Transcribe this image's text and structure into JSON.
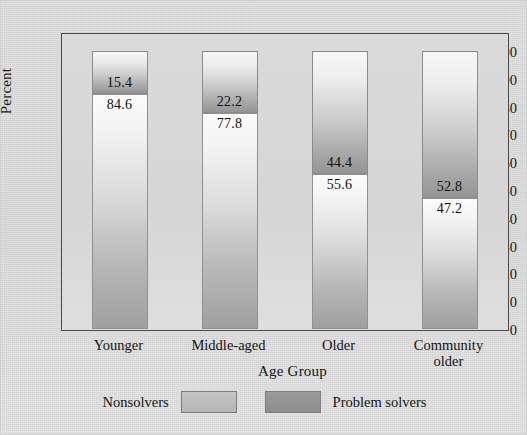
{
  "chart_data": {
    "type": "bar",
    "subtype": "stacked-bar-100",
    "title": "",
    "xlabel": "Age Group",
    "ylabel": "Percent",
    "ylim": [
      0,
      100
    ],
    "yticks": [
      0,
      10,
      20,
      30,
      40,
      50,
      60,
      70,
      80,
      90,
      100
    ],
    "ytick_labels": [
      "0",
      "10",
      "20",
      "30",
      "40",
      "50",
      "60",
      "70",
      "80",
      "90",
      "100"
    ],
    "grid": false,
    "legend_position": "bottom",
    "categories": [
      "Younger",
      "Middle-aged",
      "Older",
      "Community older"
    ],
    "category_lines": [
      [
        "Younger"
      ],
      [
        "Middle-aged"
      ],
      [
        "Older"
      ],
      [
        "Community",
        "older"
      ]
    ],
    "series": [
      {
        "name": "Nonsolvers",
        "values": [
          84.6,
          77.8,
          55.6,
          47.2
        ],
        "value_labels": [
          "84.6",
          "77.8",
          "55.6",
          "47.2"
        ],
        "color": "#bdbdbd",
        "stack_position": "bottom"
      },
      {
        "name": "Problem solvers",
        "values": [
          15.4,
          22.2,
          44.4,
          52.8
        ],
        "value_labels": [
          "15.4",
          "22.2",
          "44.4",
          "52.8"
        ],
        "color": "#949494",
        "stack_position": "top"
      }
    ]
  },
  "legend": {
    "entries": [
      {
        "label": "Nonsolvers",
        "swatch_color": "#bdbdbd"
      },
      {
        "label": "Problem solvers",
        "swatch_color": "#949494"
      }
    ]
  },
  "colors": {
    "figure_background": "#d6d6d6",
    "plot_background": "#d8d8d8",
    "axis_line": "#4a4a4a",
    "text": "#141414"
  }
}
